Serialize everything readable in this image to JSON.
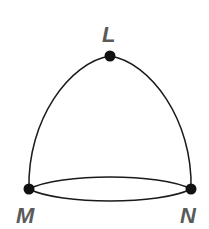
{
  "diagram": {
    "type": "graph",
    "vertices": [
      {
        "id": "L",
        "label": "L",
        "x": 110,
        "y": 56
      },
      {
        "id": "M",
        "label": "M",
        "x": 29,
        "y": 189
      },
      {
        "id": "N",
        "label": "N",
        "x": 191,
        "y": 189
      }
    ],
    "edges": [
      {
        "from": "M",
        "to": "L",
        "style": "curved"
      },
      {
        "from": "L",
        "to": "N",
        "style": "curved"
      },
      {
        "from": "M",
        "to": "N",
        "style": "curved-upper"
      },
      {
        "from": "M",
        "to": "N",
        "style": "curved-lower"
      }
    ],
    "colors": {
      "line": "#1a1a1a",
      "vertex": "#111111",
      "label": "#5a5a5a",
      "background": "#ffffff"
    }
  }
}
